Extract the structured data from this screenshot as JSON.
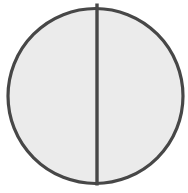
{
  "diagram": {
    "type": "circle-divided-in-half",
    "shape": "circle",
    "divider": "vertical-diameter",
    "parts": 2,
    "colors": {
      "background": "#ffffff",
      "fill": "#ebebeb",
      "stroke": "#474747"
    }
  }
}
